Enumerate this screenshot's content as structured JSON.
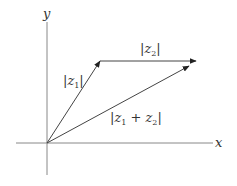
{
  "diagram": {
    "axes": {
      "x_label": "x",
      "y_label": "y",
      "color": "#888888"
    },
    "vectors": [
      {
        "id": "z1",
        "label_pre": "|z",
        "label_sub": "1",
        "label_post": "|",
        "from": [
          47,
          143
        ],
        "to": [
          100,
          61
        ]
      },
      {
        "id": "z2",
        "label_pre": "|z",
        "label_sub": "2",
        "label_post": "|",
        "from": [
          100,
          61
        ],
        "to": [
          196,
          61
        ]
      },
      {
        "id": "z1_plus_z2",
        "label_pre": "|z",
        "label_sub": "1",
        "label_mid": " + z",
        "label_sub2": "2",
        "label_post": "|",
        "from": [
          47,
          143
        ],
        "to": [
          196,
          61
        ]
      }
    ],
    "line_color": "#444444"
  }
}
